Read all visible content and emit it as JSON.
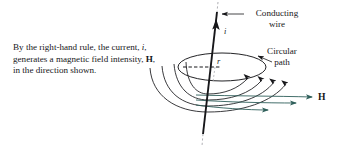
{
  "figure": {
    "name": "magnetic-field-right-hand-rule-figure",
    "background_color": "#ffffff",
    "ink_color": "#17171a",
    "arrow_accent_color": "#2f5f5a"
  },
  "caption": {
    "segment_1": "By the right-hand rule, the current, ",
    "var_i": "i",
    "segment_2": ", generates a magnetic field intensity, ",
    "var_h": "H",
    "segment_3": ", in the direction shown."
  },
  "labels": {
    "conducting_wire": "Conducting\nwire",
    "circular_path": "Circular\npath",
    "current": "i",
    "radius": "r",
    "field_intensity": "H"
  },
  "diagram": {
    "wire": {
      "label": "conducting-wire",
      "description": "vertical conductor carrying current upward"
    },
    "circular_path": {
      "label": "circular-path",
      "description": "ellipse representing circular path around wire",
      "radius_symbol": "r"
    },
    "field_lines": {
      "label": "magnetic-field-lines",
      "count": 4,
      "description": "concentric curved field lines with arrowheads"
    },
    "field_arrows": {
      "count": 3,
      "description": "horizontal arrows pointing right toward H"
    }
  }
}
